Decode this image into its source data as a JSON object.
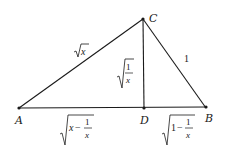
{
  "diagram": {
    "type": "right-triangle-with-altitude",
    "points": {
      "A": {
        "label": "A",
        "x": 19,
        "y": 108
      },
      "B": {
        "label": "B",
        "x": 206,
        "y": 108
      },
      "C": {
        "label": "C",
        "x": 143,
        "y": 19
      },
      "D": {
        "label": "D",
        "x": 143,
        "y": 108
      }
    },
    "segments": [
      {
        "from": "A",
        "to": "C",
        "label": "√x"
      },
      {
        "from": "C",
        "to": "B",
        "label": "1"
      },
      {
        "from": "C",
        "to": "D",
        "label": "√(1/x)"
      },
      {
        "from": "A",
        "to": "D",
        "label": "√(x − 1/x)"
      },
      {
        "from": "D",
        "to": "B",
        "label": "√(1 − 1/x)"
      }
    ],
    "labels": {
      "AC": {
        "radicand": "x"
      },
      "CB": {
        "text": "1"
      },
      "CD": {
        "num": "1",
        "den": "x"
      },
      "AD": {
        "lead": "x",
        "minus": "−",
        "num": "1",
        "den": "x"
      },
      "DB": {
        "lead": "1",
        "minus": "−",
        "num": "1",
        "den": "x"
      }
    },
    "colors": {
      "stroke": "#1a1a1a",
      "background": "#ffffff"
    }
  }
}
